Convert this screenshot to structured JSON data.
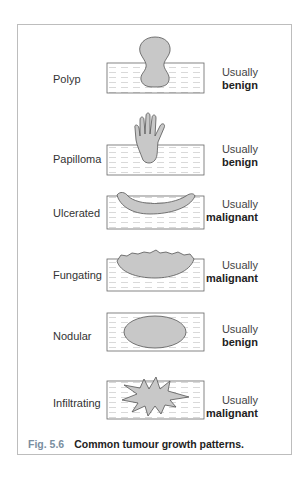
{
  "figure": {
    "number": "Fig. 5.6",
    "caption": "Common tumour growth patterns."
  },
  "rows": [
    {
      "name": "Polyp",
      "prefix": "Usually",
      "verdict": "benign"
    },
    {
      "name": "Papilloma",
      "prefix": "Usually",
      "verdict": "benign"
    },
    {
      "name": "Ulcerated",
      "prefix": "Usually",
      "verdict": "malignant"
    },
    {
      "name": "Fungating",
      "prefix": "Usually",
      "verdict": "malignant"
    },
    {
      "name": "Nodular",
      "prefix": "Usually",
      "verdict": "benign"
    },
    {
      "name": "Infiltrating",
      "prefix": "Usually",
      "verdict": "malignant"
    }
  ],
  "colors": {
    "tumour_fill": "#c8c8c8",
    "outline": "#555555",
    "frame": "#bdbdbd",
    "caption_number": "#7a8ea0"
  }
}
